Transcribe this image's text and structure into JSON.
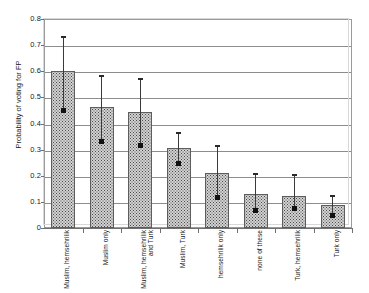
{
  "chart_data": {
    "type": "bar",
    "title": "",
    "xlabel": "",
    "ylabel": "Probability of voting for FP",
    "ylim": [
      0,
      0.8
    ],
    "ytick_labels": [
      "0.8",
      "0.7",
      "0.6",
      "0.5",
      "0.4",
      "0.3",
      "0.2",
      "0.1",
      "0"
    ],
    "ytick_values": [
      0.8,
      0.7,
      0.6,
      0.5,
      0.4,
      0.3,
      0.2,
      0.1,
      0
    ],
    "grid": "horizontal",
    "legend": "none",
    "categories": [
      "Muslim, hemsehrilik",
      "Muslim only",
      "Muslim, hemsehrilik and Turk",
      "Muslim, Turk",
      "hemsehrilik only",
      "none of these",
      "Turk, hemsehrilik",
      "Turk only"
    ],
    "values": [
      0.6,
      0.462,
      0.443,
      0.305,
      0.21,
      0.13,
      0.122,
      0.087
    ],
    "error_upper": [
      0.73,
      0.58,
      0.57,
      0.365,
      0.315,
      0.208,
      0.203,
      0.122
    ],
    "error_lower": [
      0.45,
      0.333,
      0.315,
      0.245,
      0.118,
      0.068,
      0.073,
      0.048
    ],
    "series": [
      {
        "name": "Probability of voting for FP",
        "values": [
          0.6,
          0.462,
          0.443,
          0.305,
          0.21,
          0.13,
          0.122,
          0.087
        ]
      }
    ],
    "bar_fill_color": "#d2d2d2",
    "bar_edge_color": "#5d5d5d",
    "errorbar_color": "#2a2a2a",
    "grid_color": "#8d8d8d",
    "background_color": "#ffffff"
  }
}
